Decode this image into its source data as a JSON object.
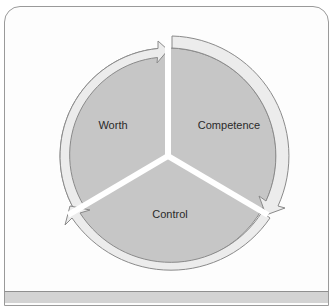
{
  "diagram": {
    "type": "cycle",
    "segments": [
      {
        "label": "Worth",
        "position": "upper-left"
      },
      {
        "label": "Competence",
        "position": "upper-right"
      },
      {
        "label": "Control",
        "position": "bottom"
      }
    ],
    "flow": "clockwise",
    "colors": {
      "segment_fill": "#c6c6c6",
      "ring_fill": "#ececec",
      "ring_stroke": "#8a8a8a",
      "divider": "#ffffff",
      "frame_stroke": "#9a9a9a",
      "footer_fill": "#d3d3d3"
    }
  }
}
